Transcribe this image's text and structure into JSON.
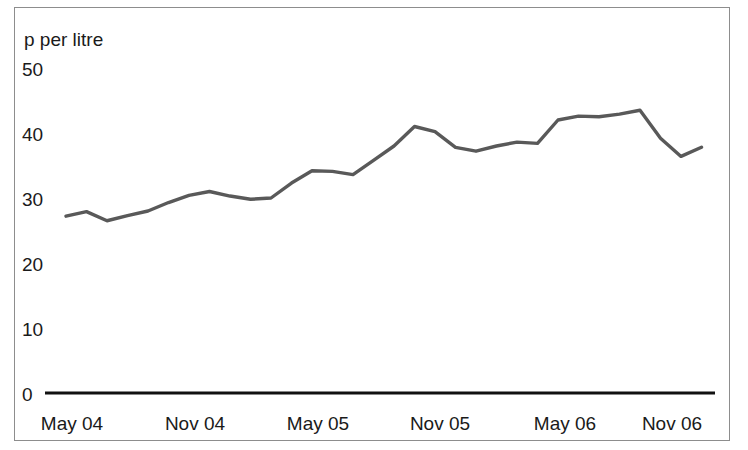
{
  "figure": {
    "title_partial": "",
    "frame_color": "#8d8d8d",
    "background": "#ffffff",
    "line_color": "#595959",
    "axis_color": "#111111"
  },
  "axis": {
    "unit_label": "p per litre",
    "y_ticks": [
      "50",
      "40",
      "30",
      "20",
      "10",
      "0"
    ],
    "x_ticks": [
      "May 04",
      "Nov 04",
      "May 05",
      "Nov 05",
      "May 06",
      "Nov 06"
    ]
  },
  "chart_data": {
    "type": "line",
    "title": "",
    "xlabel": "",
    "ylabel": "p per litre",
    "ylim": [
      0,
      50
    ],
    "yticks": [
      0,
      10,
      20,
      30,
      40,
      50
    ],
    "grid": false,
    "legend": null,
    "xticklabels": [
      "May 04",
      "Nov 04",
      "May 05",
      "Nov 05",
      "May 06",
      "Nov 06"
    ],
    "x": [
      "May 04",
      "Jun 04",
      "Jul 04",
      "Aug 04",
      "Sep 04",
      "Oct 04",
      "Nov 04",
      "Dec 04",
      "Jan 05",
      "Feb 05",
      "Mar 05",
      "Apr 05",
      "May 05",
      "Jun 05",
      "Jul 05",
      "Aug 05",
      "Sep 05",
      "Oct 05",
      "Nov 05",
      "Dec 05",
      "Jan 06",
      "Feb 06",
      "Mar 06",
      "Apr 06",
      "May 06",
      "Jun 06",
      "Jul 06",
      "Aug 06",
      "Sep 06",
      "Oct 06",
      "Nov 06",
      "Dec 06"
    ],
    "series": [
      {
        "name": "p per litre",
        "values": [
          27.2,
          27.9,
          26.5,
          27.3,
          28.0,
          29.3,
          30.4,
          31.0,
          30.3,
          29.8,
          30.0,
          32.3,
          34.2,
          34.1,
          33.6,
          35.8,
          38.0,
          41.0,
          40.2,
          37.8,
          37.2,
          38.0,
          38.6,
          38.4,
          42.0,
          42.6,
          42.5,
          42.9,
          43.5,
          39.2,
          36.4,
          37.8
        ]
      }
    ]
  },
  "geometry": {
    "x_start_px": 66,
    "x_step_px": 20.5,
    "y_zero_px": 393,
    "y_per_unit_px": 6.5,
    "axis_line": {
      "x1": 45,
      "x2": 715,
      "y": 393
    }
  }
}
